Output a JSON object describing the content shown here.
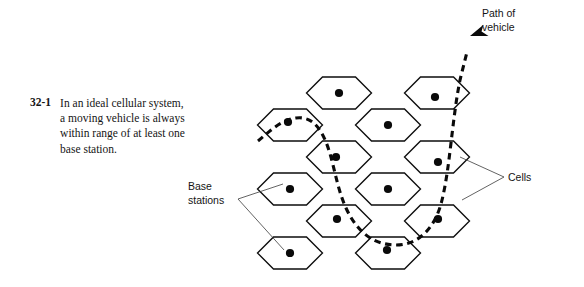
{
  "figure": {
    "number": "32-1",
    "caption": "In an ideal cellular system, a moving vehicle is always within range of at least one base station.",
    "labels": {
      "path_of_vehicle_line1": "Path of",
      "path_of_vehicle_line2": "vehicle",
      "base_stations_line1": "Base",
      "base_stations_line2": "stations",
      "cells": "Cells"
    },
    "colors": {
      "cell_outline": "#0d0d0d",
      "cell_fill": "#ffffff",
      "station_dot": "#0a0a0a",
      "path_stroke": "#0a0a0a",
      "leader_line": "#3b3b3b",
      "text": "#151515",
      "background": "#ffffff"
    },
    "geometry": {
      "hex_half_width": 32.5,
      "hex_half_height": 32,
      "hex_point_inset": 16,
      "station_dot_radius": 4.1,
      "columns": [
        {
          "center_x": 290,
          "row_centers": [
            125,
            189,
            253
          ]
        },
        {
          "center_x": 339,
          "row_centers": [
            93,
            157,
            221
          ]
        },
        {
          "center_x": 388,
          "row_centers": [
            125,
            189,
            253
          ]
        },
        {
          "center_x": 437,
          "row_centers": [
            93,
            157,
            221
          ]
        }
      ]
    },
    "cells": [
      {
        "id": "cell-c1-r1",
        "cx": 290,
        "cy": 125,
        "has_station": true,
        "station_cx": 288,
        "station_cy": 122
      },
      {
        "id": "cell-c1-r2",
        "cx": 290,
        "cy": 189,
        "has_station": true,
        "station_cx": 290,
        "station_cy": 189
      },
      {
        "id": "cell-c1-r3",
        "cx": 290,
        "cy": 253,
        "has_station": true,
        "station_cx": 290,
        "station_cy": 253
      },
      {
        "id": "cell-c2-r1",
        "cx": 339,
        "cy": 93,
        "has_station": true,
        "station_cx": 339,
        "station_cy": 93
      },
      {
        "id": "cell-c2-r2",
        "cx": 339,
        "cy": 157,
        "has_station": true,
        "station_cx": 336,
        "station_cy": 157
      },
      {
        "id": "cell-c2-r3",
        "cx": 339,
        "cy": 221,
        "has_station": true,
        "station_cx": 337,
        "station_cy": 219
      },
      {
        "id": "cell-c3-r1",
        "cx": 388,
        "cy": 125,
        "has_station": true,
        "station_cx": 388,
        "station_cy": 125
      },
      {
        "id": "cell-c3-r2",
        "cx": 388,
        "cy": 189,
        "has_station": true,
        "station_cx": 388,
        "station_cy": 189
      },
      {
        "id": "cell-c3-r3",
        "cx": 388,
        "cy": 253,
        "has_station": true,
        "station_cx": 387,
        "station_cy": 250
      },
      {
        "id": "cell-c4-r1",
        "cx": 437,
        "cy": 93,
        "has_station": true,
        "station_cx": 435,
        "station_cy": 97
      },
      {
        "id": "cell-c4-r2",
        "cx": 437,
        "cy": 157,
        "has_station": true,
        "station_cx": 438,
        "station_cy": 162
      },
      {
        "id": "cell-c4-r3",
        "cx": 437,
        "cy": 221,
        "has_station": true,
        "station_cx": 438,
        "station_cy": 219
      },
      {
        "id": "cell-c2-r0",
        "cx": 339,
        "cy": 93,
        "has_station": false,
        "station_cx": 0,
        "station_cy": 0
      }
    ],
    "path": {
      "description": "dashed S-shaped trajectory of a moving vehicle crossing several cells, arrow at the upper right",
      "d": "M 258 141 C 268 133 280 120 296 118 C 312 116 320 128 326 142 C 334 162 336 186 346 208 C 356 230 372 245 396 245 C 420 245 436 226 442 200 C 450 168 452 120 460 80 L 467 52",
      "arrow": {
        "tip_x": 470,
        "tip_y": 36,
        "angle_deg": -19
      }
    },
    "leaders": {
      "cells": [
        {
          "from_x": 504,
          "from_y": 177,
          "to_x": 460,
          "to_y": 157
        },
        {
          "from_x": 504,
          "from_y": 177,
          "to_x": 462,
          "to_y": 200
        }
      ],
      "base_stations": [
        {
          "from_x": 238,
          "from_y": 199,
          "to_x": 283,
          "to_y": 184
        },
        {
          "from_x": 238,
          "from_y": 199,
          "to_x": 284,
          "to_y": 250
        }
      ]
    }
  }
}
